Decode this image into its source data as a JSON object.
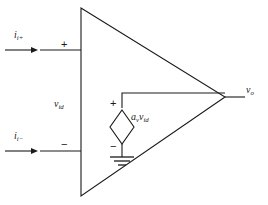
{
  "diagram": {
    "background_color": "#ffffff",
    "line_color": "#1a1a1a",
    "labels": {
      "input_current_plus": {
        "symbol": "i",
        "subscript": "i+"
      },
      "input_current_minus": {
        "symbol": "i",
        "subscript": "i−"
      },
      "differential_voltage": {
        "symbol": "v",
        "subscript": "id"
      },
      "dependent_source": {
        "gain_symbol": "a",
        "gain_subscript": "v",
        "symbol": "v",
        "subscript": "id"
      },
      "output_voltage": {
        "symbol": "v",
        "subscript": "o"
      },
      "input_plus_sign": "+",
      "input_minus_sign": "−",
      "source_plus_sign": "+",
      "source_minus_sign": "−"
    },
    "components": {
      "amplifier_triangle": "triangle",
      "dependent_voltage_source": "diamond",
      "ground": "ground-symbol",
      "input_arrow_plus": "arrow-right",
      "input_arrow_minus": "arrow-right"
    }
  }
}
